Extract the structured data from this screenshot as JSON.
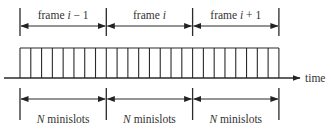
{
  "diagram": {
    "type": "timeline",
    "frames": [
      {
        "name": "frame",
        "index_label": "i − 1",
        "slot_label_var": "N",
        "slot_label_text": "minislots"
      },
      {
        "name": "frame",
        "index_label": "i",
        "slot_label_var": "N",
        "slot_label_text": "minislots"
      },
      {
        "name": "frame",
        "index_label": "i + 1",
        "slot_label_var": "N",
        "slot_label_text": "minislots"
      }
    ],
    "minislots_per_frame": 8,
    "axis_label": "time",
    "colors": {
      "line": "#2a2a2a",
      "text": "#333333",
      "background": "#ffffff"
    }
  }
}
